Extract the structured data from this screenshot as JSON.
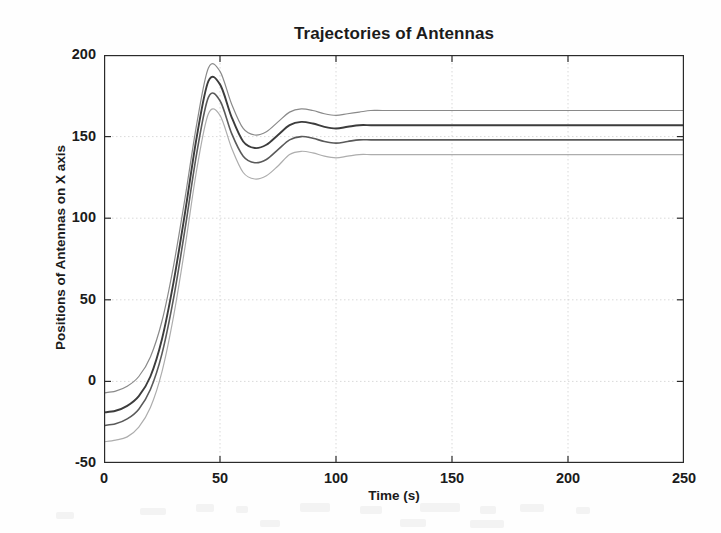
{
  "chart_data": {
    "type": "line",
    "title": "Trajectories of Antennas",
    "xlabel": "Time (s)",
    "ylabel": "Positions of Antennas on X axis",
    "xlim": [
      0,
      250
    ],
    "ylim": [
      -50,
      200
    ],
    "xticks": [
      0,
      50,
      100,
      150,
      200,
      250
    ],
    "yticks": [
      -50,
      0,
      50,
      100,
      150,
      200
    ],
    "grid": true,
    "legend": "none",
    "series": [
      {
        "name": "Antenna 1",
        "color": "#8a8a8a",
        "linewidth": 1.2,
        "start_value": -7,
        "peak_time": 45,
        "peak_value": 193,
        "trough_time": 64,
        "trough_value": 151,
        "second_peak_time": 82,
        "second_peak_value": 167,
        "settled_value": 166,
        "x": [
          0,
          5,
          10,
          15,
          20,
          25,
          30,
          35,
          40,
          45,
          50,
          55,
          60,
          65,
          70,
          75,
          80,
          85,
          90,
          95,
          100,
          105,
          110,
          115,
          120,
          130,
          140,
          150,
          160,
          170,
          180,
          190,
          200,
          210,
          220,
          230,
          240,
          250
        ],
        "y": [
          -7,
          -6,
          -3,
          3,
          15,
          37,
          71,
          113,
          158,
          192,
          190,
          170,
          155,
          151,
          153,
          159,
          165,
          167,
          166,
          164,
          163,
          164,
          165,
          166,
          166,
          166,
          166,
          166,
          166,
          166,
          166,
          166,
          166,
          166,
          166,
          166,
          166,
          166
        ]
      },
      {
        "name": "Antenna 2",
        "color": "#3c3c3c",
        "linewidth": 1.9,
        "start_value": -19,
        "peak_time": 45,
        "peak_value": 184,
        "trough_time": 65,
        "trough_value": 143,
        "second_peak_time": 83,
        "second_peak_value": 158,
        "settled_value": 157,
        "x": [
          0,
          5,
          10,
          15,
          20,
          25,
          30,
          35,
          40,
          45,
          50,
          55,
          60,
          65,
          70,
          75,
          80,
          85,
          90,
          95,
          100,
          105,
          110,
          115,
          120,
          130,
          140,
          150,
          160,
          170,
          180,
          190,
          200,
          210,
          220,
          230,
          240,
          250
        ],
        "y": [
          -19,
          -18,
          -15,
          -9,
          3,
          26,
          61,
          104,
          150,
          184,
          182,
          162,
          147,
          143,
          145,
          151,
          157,
          159,
          158,
          156,
          155,
          156,
          157,
          157,
          157,
          157,
          157,
          157,
          157,
          157,
          157,
          157,
          157,
          157,
          157,
          157,
          157,
          157
        ]
      },
      {
        "name": "Antenna 3",
        "color": "#5a5a5a",
        "linewidth": 1.6,
        "start_value": -27,
        "peak_time": 45,
        "peak_value": 174,
        "trough_time": 66,
        "trough_value": 134,
        "second_peak_time": 83,
        "second_peak_value": 149,
        "settled_value": 148,
        "x": [
          0,
          5,
          10,
          15,
          20,
          25,
          30,
          35,
          40,
          45,
          50,
          55,
          60,
          65,
          70,
          75,
          80,
          85,
          90,
          95,
          100,
          105,
          110,
          115,
          120,
          130,
          140,
          150,
          160,
          170,
          180,
          190,
          200,
          210,
          220,
          230,
          240,
          250
        ],
        "y": [
          -27,
          -26,
          -23,
          -17,
          -5,
          17,
          51,
          94,
          140,
          174,
          172,
          152,
          138,
          134,
          136,
          142,
          148,
          150,
          149,
          147,
          146,
          147,
          148,
          148,
          148,
          148,
          148,
          148,
          148,
          148,
          148,
          148,
          148,
          148,
          148,
          148,
          148,
          148
        ]
      },
      {
        "name": "Antenna 4",
        "color": "#adadad",
        "linewidth": 1.2,
        "start_value": -37,
        "peak_time": 46,
        "peak_value": 165,
        "trough_time": 67,
        "trough_value": 124,
        "second_peak_time": 84,
        "second_peak_value": 140,
        "settled_value": 139,
        "x": [
          0,
          5,
          10,
          15,
          20,
          25,
          30,
          35,
          40,
          45,
          50,
          55,
          60,
          65,
          70,
          75,
          80,
          85,
          90,
          95,
          100,
          105,
          110,
          115,
          120,
          130,
          140,
          150,
          160,
          170,
          180,
          190,
          200,
          210,
          220,
          230,
          240,
          250
        ],
        "y": [
          -37,
          -36,
          -34,
          -28,
          -16,
          6,
          40,
          83,
          130,
          164,
          163,
          143,
          128,
          124,
          126,
          132,
          139,
          141,
          140,
          138,
          137,
          138,
          139,
          139,
          139,
          139,
          139,
          139,
          139,
          139,
          139,
          139,
          139,
          139,
          139,
          139,
          139,
          139
        ]
      }
    ]
  },
  "axes": {
    "frame_color": "#2a2a2a",
    "grid_color": "#cfcfcf",
    "background": "#ffffff"
  }
}
